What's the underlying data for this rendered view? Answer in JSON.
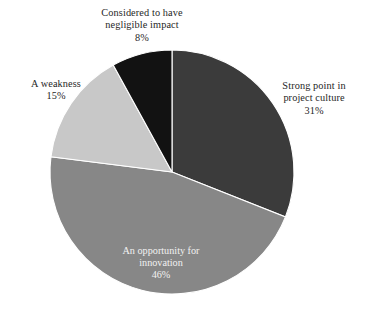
{
  "chart_data": {
    "type": "pie",
    "title": "",
    "subtitle": "",
    "xlabel": "",
    "ylabel": "",
    "grid": false,
    "legend": "none",
    "label_format": "name + percent",
    "start_angle_deg": 0,
    "direction": "clockwise",
    "categories": [
      "Strong point in project culture",
      "An opportunity for innovation",
      "A weakness",
      "Considered to have negligible impact"
    ],
    "values": [
      31,
      46,
      15,
      8
    ],
    "value_unit": "%",
    "colors": [
      "#3b3b3b",
      "#878787",
      "#c8c8c8",
      "#121212"
    ],
    "slices": [
      {
        "name": "Strong point in project culture",
        "value": 31,
        "percent_text": "31%",
        "color": "#3b3b3b",
        "label_line_1": "Strong point in",
        "label_line_2": "project culture",
        "label_placement": "outside-right",
        "label_color": "#1f1f1f"
      },
      {
        "name": "An opportunity for innovation",
        "value": 46,
        "percent_text": "46%",
        "color": "#878787",
        "label_line_1": "An opportunity for",
        "label_line_2": "innovation",
        "label_placement": "inside",
        "label_color": "#f2f2f2"
      },
      {
        "name": "A weakness",
        "value": 15,
        "percent_text": "15%",
        "color": "#c8c8c8",
        "label_line_1": "A weakness",
        "label_line_2": "",
        "label_placement": "outside-left",
        "label_color": "#1f1f1f"
      },
      {
        "name": "Considered to have negligible impact",
        "value": 8,
        "percent_text": "8%",
        "color": "#121212",
        "label_line_1": "Considered to have",
        "label_line_2": "negligible impact",
        "label_placement": "outside-top",
        "label_color": "#1f1f1f"
      }
    ]
  },
  "figure": {
    "background_color": "#ffffff",
    "separator_color": "#ffffff",
    "center_x": 172,
    "center_y": 172,
    "radius": 122
  },
  "artifact": {
    "cropped_caption_text": "partially cropped text line"
  }
}
